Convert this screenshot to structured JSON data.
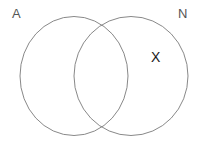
{
  "diagram": {
    "type": "venn-two-set",
    "background_color": "#ffffff",
    "stroke_color": "#7a7a7a",
    "stroke_width": 0.9,
    "canvas": {
      "width": 201,
      "height": 144
    },
    "sets": [
      {
        "id": "A",
        "label": "A",
        "label_color": "#555555",
        "side": "left",
        "center": {
          "x": 74,
          "y": 76
        },
        "radius": {
          "rx": 54,
          "ry": 60
        }
      },
      {
        "id": "N",
        "label": "N",
        "label_color": "#555555",
        "side": "right",
        "center": {
          "x": 131,
          "y": 76
        },
        "radius": {
          "rx": 57,
          "ry": 60
        }
      }
    ],
    "marks": [
      {
        "id": "x-mark",
        "glyph": "X",
        "color": "#1a1a1a",
        "region": "N-only",
        "position": {
          "x": 156,
          "y": 57
        }
      }
    ],
    "intersection_points": [
      {
        "x": 100,
        "y": 20
      },
      {
        "x": 100,
        "y": 131
      }
    ]
  }
}
